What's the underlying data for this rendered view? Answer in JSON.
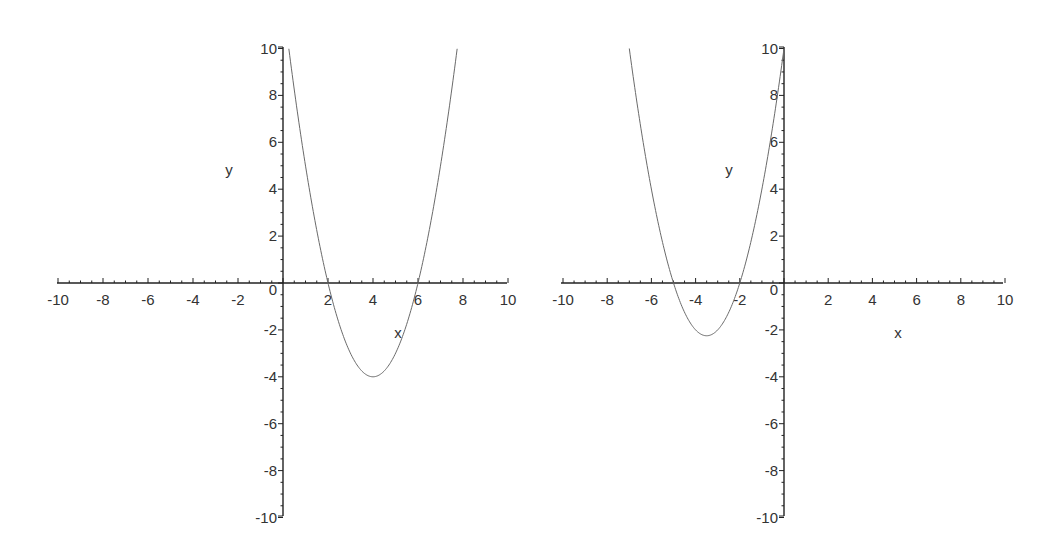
{
  "chart_data": [
    {
      "type": "line",
      "title": "",
      "function": "y = x^2 - 8x + 12",
      "xlabel": "x",
      "ylabel": "y",
      "xlim": [
        -10,
        10
      ],
      "ylim": [
        -10,
        10
      ],
      "grid": false,
      "x_ticks": [
        "-10",
        "-8",
        "-6",
        "-4",
        "-2",
        "2",
        "4",
        "6",
        "8",
        "10"
      ],
      "y_ticks": [
        "10",
        "8",
        "6",
        "4",
        "2",
        "0",
        "-2",
        "-4",
        "-6",
        "-8",
        "-10"
      ],
      "origin_label": "0",
      "roots": [
        2,
        6
      ],
      "vertex": [
        4,
        -4
      ],
      "series": [
        {
          "name": "parabola",
          "x": [
            0.26,
            1,
            2,
            3,
            4,
            5,
            6,
            7,
            7.74
          ],
          "y": [
            10,
            5,
            0,
            -3,
            -4,
            -3,
            0,
            5,
            10
          ]
        }
      ],
      "color": "#6a6a6a",
      "placement": {
        "origin_px": [
          283,
          283
        ],
        "x_min_px": 57,
        "x_max_px": 507,
        "y_max_px": 47,
        "y_min_px": 516,
        "xlabel_px": [
          398,
          338
        ],
        "ylabel_px": [
          229,
          175
        ]
      }
    },
    {
      "type": "line",
      "title": "",
      "function": "y = x^2 + 7x + 10",
      "xlabel": "x",
      "ylabel": "y",
      "xlim": [
        -10,
        10
      ],
      "ylim": [
        -10,
        10
      ],
      "grid": false,
      "x_ticks": [
        "-10",
        "-8",
        "-6",
        "-4",
        "-2",
        "2",
        "4",
        "6",
        "8",
        "10"
      ],
      "y_ticks": [
        "10",
        "8",
        "6",
        "4",
        "2",
        "0",
        "-2",
        "-4",
        "-6",
        "-8",
        "-10"
      ],
      "origin_label": "0",
      "roots": [
        -5,
        -2
      ],
      "vertex": [
        -3.5,
        -2.25
      ],
      "series": [
        {
          "name": "parabola",
          "x": [
            -7,
            -6,
            -5,
            -4,
            -3.5,
            -3,
            -2,
            -1,
            0
          ],
          "y": [
            10,
            4,
            0,
            -2,
            -2.25,
            -2,
            0,
            4,
            10
          ]
        }
      ],
      "color": "#6a6a6a",
      "placement": {
        "origin_px": [
          784,
          283
        ],
        "x_min_px": 561,
        "x_max_px": 1003,
        "y_max_px": 47,
        "y_min_px": 516,
        "xlabel_px": [
          898,
          338
        ],
        "ylabel_px": [
          729,
          175
        ]
      }
    }
  ]
}
